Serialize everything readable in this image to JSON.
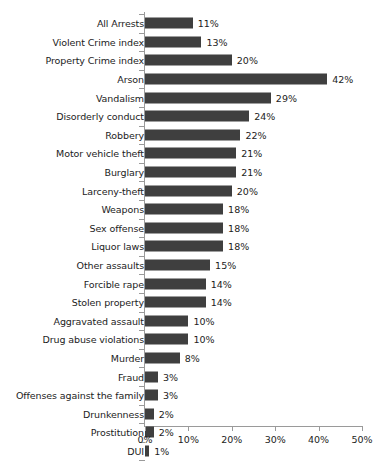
{
  "chart_data": {
    "type": "bar",
    "orientation": "horizontal",
    "title": "",
    "xlabel": "",
    "ylabel": "",
    "xlim": [
      0,
      50
    ],
    "xticks": [
      0,
      10,
      20,
      30,
      40,
      50
    ],
    "xtick_labels": [
      "0%",
      "10%",
      "20%",
      "30%",
      "40%",
      "50%"
    ],
    "grid": false,
    "legend": null,
    "bar_color": "#3f3f3f",
    "axis_color": "#9a9a9a",
    "background_color": "#ffffff",
    "value_suffix": "%",
    "categories": [
      "All Arrests",
      "Violent Crime index",
      "Property Crime index",
      "Arson",
      "Vandalism",
      "Disorderly conduct",
      "Robbery",
      "Motor vehicle theft",
      "Burglary",
      "Larceny-theft",
      "Weapons",
      "Sex offense",
      "Liquor laws",
      "Other assaults",
      "Forcible rape",
      "Stolen property",
      "Aggravated assault",
      "Drug abuse violations",
      "Murder",
      "Fraud",
      "Offenses against the family",
      "Drunkenness",
      "Prostitution",
      "DUI"
    ],
    "values": [
      11,
      13,
      20,
      42,
      29,
      24,
      22,
      21,
      21,
      20,
      18,
      18,
      18,
      15,
      14,
      14,
      10,
      10,
      8,
      3,
      3,
      2,
      2,
      1
    ],
    "value_labels": [
      "11%",
      "13%",
      "20%",
      "42%",
      "29%",
      "24%",
      "22%",
      "21%",
      "21%",
      "20%",
      "18%",
      "18%",
      "18%",
      "15%",
      "14%",
      "14%",
      "10%",
      "10%",
      "8%",
      "3%",
      "3%",
      "2%",
      "2%",
      "1%"
    ]
  }
}
